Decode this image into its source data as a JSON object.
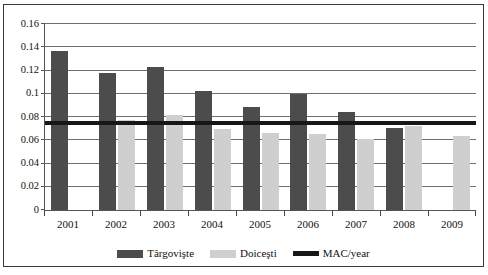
{
  "chart_data": {
    "type": "bar",
    "title": "",
    "subtitle": "",
    "xlabel": "",
    "ylabel": "",
    "categories": [
      "2001",
      "2002",
      "2003",
      "2004",
      "2005",
      "2006",
      "2007",
      "2008",
      "2009"
    ],
    "series": [
      {
        "name": "Târgovişte",
        "color": "#4c4c4c",
        "values": [
          0.136,
          0.117,
          0.122,
          0.102,
          0.088,
          0.099,
          0.084,
          0.07,
          null
        ]
      },
      {
        "name": "Doiceşti",
        "color": "#cfcfcf",
        "values": [
          null,
          0.077,
          0.081,
          0.069,
          0.066,
          0.065,
          0.061,
          0.072,
          0.063
        ]
      }
    ],
    "reference_lines": [
      {
        "name": "MAC/year",
        "color": "#171717",
        "value": 0.075,
        "orientation": "horizontal"
      }
    ],
    "ylim": [
      0,
      0.16
    ],
    "ytick_step": 0.02,
    "yticks": [
      "0",
      "0.02",
      "0.04",
      "0.06",
      "0.08",
      "0.1",
      "0.12",
      "0.14",
      "0.16"
    ],
    "ytick_values": [
      0,
      0.02,
      0.04,
      0.06,
      0.08,
      0.1,
      0.12,
      0.14,
      0.16
    ],
    "grid": true,
    "grid_axis": "y",
    "legend": {
      "position": "bottom",
      "entries": [
        {
          "label": "Târgovişte",
          "color": "#4c4c4c",
          "marker": "swatch"
        },
        {
          "label": "Doiceşti",
          "color": "#cfcfcf",
          "marker": "swatch"
        },
        {
          "label": "MAC/year",
          "color": "#171717",
          "marker": "line"
        }
      ]
    },
    "frame": {
      "border_color": "#3a3a3a",
      "background": "#ffffff"
    }
  }
}
